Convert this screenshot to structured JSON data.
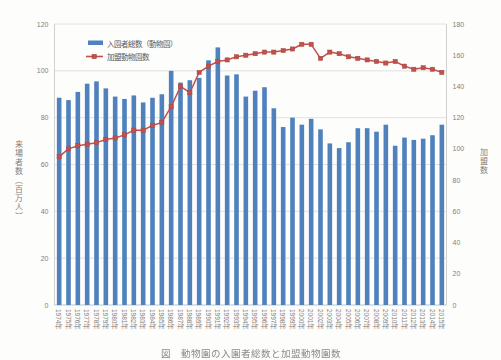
{
  "chart_data": {
    "type": "bar",
    "combo": "bar+line",
    "title": "",
    "categories": [
      "1974年",
      "1975年",
      "1976年",
      "1977年",
      "1978年",
      "1979年",
      "1980年",
      "1981年",
      "1982年",
      "1983年",
      "1984年",
      "1985年",
      "1986年",
      "1987年",
      "1988年",
      "1989年",
      "1990年",
      "1991年",
      "1992年",
      "1993年",
      "1994年",
      "1995年",
      "1996年",
      "1997年",
      "1998年",
      "1999年",
      "2000年",
      "2001年",
      "2002年",
      "2003年",
      "2004年",
      "2005年",
      "2006年",
      "2007年",
      "2008年",
      "2009年",
      "2010年",
      "2011年",
      "2012年",
      "2013年",
      "2014年",
      "2015年"
    ],
    "series": [
      {
        "name": "入園者総数（動物園）",
        "type": "bar",
        "axis": "left",
        "color": "#4F81BD",
        "values": [
          88.5,
          87.5,
          91,
          94.5,
          95.5,
          92.5,
          89,
          88,
          89.5,
          86.5,
          88.5,
          90,
          100,
          95,
          96,
          97,
          104.5,
          110,
          98,
          98.5,
          89,
          91.5,
          93,
          84,
          76,
          80,
          77,
          79.5,
          75,
          69,
          67,
          69.5,
          75.5,
          75.5,
          74,
          77,
          68,
          71.5,
          70.5,
          71,
          72.5,
          77
        ]
      },
      {
        "name": "加盟動物園数",
        "type": "line",
        "axis": "right",
        "color": "#C0504D",
        "marker": "square",
        "values": [
          95,
          100,
          102,
          103,
          104,
          106,
          107,
          109,
          112,
          112,
          115,
          117,
          127,
          140,
          136,
          149,
          153,
          156,
          157,
          159,
          160,
          161,
          162,
          162,
          163,
          164,
          167,
          167,
          158,
          162,
          161,
          159,
          158,
          157,
          156,
          155,
          156,
          153,
          151,
          152,
          151,
          149
        ]
      }
    ],
    "left_axis": {
      "label": "来場者数（百万人）",
      "min": 0,
      "max": 120,
      "tick_step": 20,
      "ticks": [
        "0",
        "20",
        "40",
        "60",
        "80",
        "100",
        "120"
      ]
    },
    "right_axis": {
      "label": "加盟数",
      "min": 0,
      "max": 180,
      "tick_step": 20,
      "ticks": [
        "0",
        "20",
        "40",
        "60",
        "80",
        "100",
        "120",
        "140",
        "160",
        "180"
      ]
    },
    "grid": true,
    "legend_position": "top-left-inside",
    "x_tick_rotation_deg": 90
  },
  "legend": {
    "bar_label": "入園者総数（動物園）",
    "line_label": "加盟動物園数"
  },
  "caption": "図　動物園の入園者総数と加盟動物園数",
  "colors": {
    "bar": "#4F81BD",
    "line": "#C0504D",
    "grid": "#DADADA",
    "axis_line": "#C5C5C3",
    "tick_text": "#7F7F7F",
    "legend_text": "#595959",
    "plot_background": "#FDFDFC"
  }
}
